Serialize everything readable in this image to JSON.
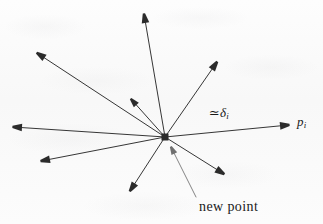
{
  "figure": {
    "name": "vector-star-diagram",
    "width": 323,
    "height": 224,
    "background_color": "#fbfbfb",
    "ink_color": "#2b2b2b",
    "leader_color": "#6f6f6f"
  },
  "hub": {
    "name": "new-point-marker",
    "shape": "filled-square",
    "x": 165,
    "y": 137,
    "size": 7
  },
  "labels": {
    "delta": {
      "text": "≃ δi",
      "approx_symbol": "≃",
      "variable": "δ",
      "subscript": "i",
      "x": 209,
      "y": 106
    },
    "pi": {
      "text": "pi",
      "variable": "p",
      "subscript": "i",
      "x": 297,
      "y": 115
    },
    "new_point": {
      "text": "new point",
      "x": 199,
      "y": 200
    }
  },
  "leader_line": {
    "name": "new-point-leader",
    "from_x": 196,
    "from_y": 197,
    "to_x": 171,
    "to_y": 147,
    "has_arrowhead": true
  },
  "vectors": [
    {
      "name": "vector-up",
      "direction": "up",
      "x1": 165,
      "y1": 137,
      "x2": 144,
      "y2": 14,
      "head": 9
    },
    {
      "name": "vector-upper-right",
      "direction": "upper-right",
      "x1": 165,
      "y1": 137,
      "x2": 217,
      "y2": 62,
      "head": 9
    },
    {
      "name": "vector-right",
      "direction": "right",
      "x1": 165,
      "y1": 137,
      "x2": 289,
      "y2": 125,
      "head": 9
    },
    {
      "name": "vector-lower-right",
      "direction": "lower-right",
      "x1": 165,
      "y1": 137,
      "x2": 224,
      "y2": 174,
      "head": 9
    },
    {
      "name": "vector-down",
      "direction": "down",
      "x1": 165,
      "y1": 137,
      "x2": 130,
      "y2": 191,
      "head": 9
    },
    {
      "name": "vector-lower-left",
      "direction": "lower-left",
      "x1": 165,
      "y1": 137,
      "x2": 41,
      "y2": 161,
      "head": 9
    },
    {
      "name": "vector-left",
      "direction": "left",
      "x1": 165,
      "y1": 137,
      "x2": 13,
      "y2": 127,
      "head": 9
    },
    {
      "name": "vector-upper-left",
      "direction": "upper-left",
      "x1": 165,
      "y1": 137,
      "x2": 37,
      "y2": 53,
      "head": 9
    },
    {
      "name": "vector-upper-left-short",
      "direction": "upper-left-short",
      "x1": 165,
      "y1": 137,
      "x2": 131,
      "y2": 99,
      "head": 8
    }
  ]
}
